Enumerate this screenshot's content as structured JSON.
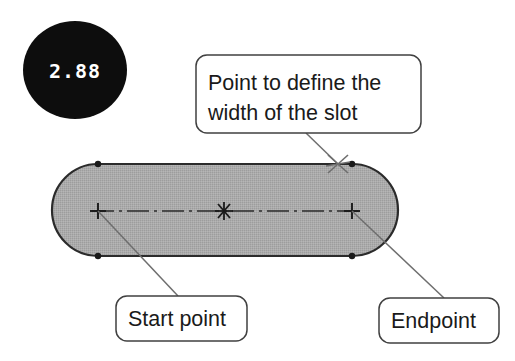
{
  "figure": {
    "kind": "cad-slot-sketch-diagram",
    "background_color": "#ffffff",
    "badge": {
      "value": "2.88",
      "shape": "ellipse",
      "fill_color": "#0d0d0d",
      "text_color": "#ffffff"
    },
    "slot": {
      "name": "slot-shape",
      "fill_color": "#a9a9a9",
      "stroke_color": "#2b2b2b",
      "centerline_color": "#2b2b2b",
      "tangent_dot_color": "#1a1a1a",
      "markers": {
        "start_point": "+",
        "end_point": "+",
        "center_point": "*",
        "width_point": "x"
      }
    },
    "callouts": [
      {
        "id": "width-callout",
        "line1": "Point to define the",
        "line2": "width of the slot",
        "box_fill": "#ffffff",
        "box_stroke": "#404040"
      },
      {
        "id": "start-point-callout",
        "line1": "Start point",
        "line2": "",
        "box_fill": "#ffffff",
        "box_stroke": "#404040"
      },
      {
        "id": "endpoint-callout",
        "line1": "Endpoint",
        "line2": "",
        "box_fill": "#ffffff",
        "box_stroke": "#404040"
      }
    ]
  }
}
